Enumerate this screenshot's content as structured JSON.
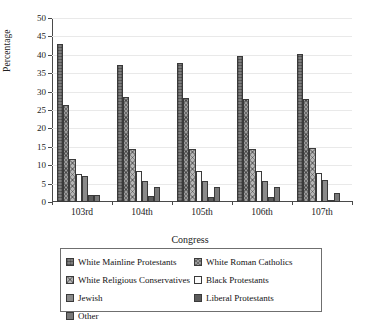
{
  "chart_data": {
    "type": "bar",
    "title": "",
    "xlabel": "Congress",
    "ylabel": "Percentage",
    "categories": [
      "103rd",
      "104th",
      "105th",
      "106th",
      "107th"
    ],
    "ylim": [
      0,
      50
    ],
    "ytick_step": 5,
    "yticks": [
      "0",
      "5",
      "10",
      "15",
      "20",
      "25",
      "30",
      "35",
      "40",
      "45",
      "50"
    ],
    "grid": true,
    "legend_position": "bottom",
    "series": [
      {
        "name": "White Mainline Protestants",
        "values": [
          43.0,
          37.2,
          37.8,
          39.6,
          40.3
        ]
      },
      {
        "name": "White Roman Catholics",
        "values": [
          26.3,
          28.6,
          28.2,
          28.0,
          28.1
        ]
      },
      {
        "name": "White Religious Conservatives",
        "values": [
          11.8,
          14.5,
          14.5,
          14.5,
          14.7
        ]
      },
      {
        "name": "Black Protestants",
        "values": [
          7.5,
          8.4,
          8.4,
          8.4,
          8.0
        ]
      },
      {
        "name": "Jewish",
        "values": [
          7.0,
          5.6,
          5.6,
          5.6,
          6.0
        ]
      },
      {
        "name": "Liberal Protestants",
        "values": [
          2.0,
          1.5,
          1.3,
          1.3,
          0.5
        ]
      },
      {
        "name": "Other",
        "values": [
          1.9,
          4.0,
          4.0,
          4.0,
          2.5
        ]
      }
    ]
  },
  "legend": {
    "entries": [
      {
        "label": "White Mainline Protestants",
        "swatch": "dark-grid-swatch"
      },
      {
        "label": "White Roman Catholics",
        "swatch": "cross-hatch-swatch"
      },
      {
        "label": "White Religious Conservatives",
        "swatch": "light-cross-hatch-swatch"
      },
      {
        "label": "Black Protestants",
        "swatch": "white-swatch"
      },
      {
        "label": "Jewish",
        "swatch": "medium-grey-swatch"
      },
      {
        "label": "Liberal Protestants",
        "swatch": "dark-solid-swatch"
      },
      {
        "label": "Other",
        "swatch": "grey-swatch"
      }
    ]
  },
  "colors": {
    "axis": "#4a4a4a",
    "grid": "#e9e9e9",
    "text": "#1a1a1a",
    "background": "#ffffff"
  }
}
